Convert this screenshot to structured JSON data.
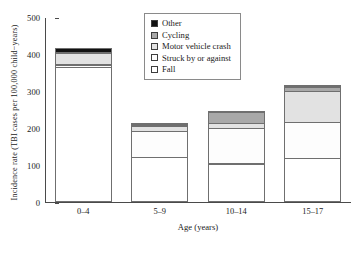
{
  "chart_data": {
    "type": "bar",
    "stacked": true,
    "title": "",
    "xlabel": "Age (years)",
    "ylabel": "Incidence rate (TBI cases per 100,000 child−years)",
    "categories": [
      "0–4",
      "5–9",
      "10–14",
      "15–17"
    ],
    "ylim": [
      0,
      500
    ],
    "yticks": [
      0,
      100,
      200,
      300,
      400,
      500
    ],
    "grid": false,
    "legend_position": "top-center",
    "series": [
      {
        "name": "Fall",
        "color": "#ffffff",
        "values": [
          365,
          122,
          104,
          118
        ]
      },
      {
        "name": "Struck by or against",
        "color": "#fdfdfd",
        "values": [
          8,
          72,
          97,
          99
        ]
      },
      {
        "name": "Motor vehicle crash",
        "color": "#e2e2e2",
        "values": [
          33,
          14,
          16,
          87
        ]
      },
      {
        "name": "Cycling",
        "color": "#a8a8a8",
        "values": [
          4,
          7,
          31,
          13
        ]
      },
      {
        "name": "Other",
        "color": "#111111",
        "values": [
          12,
          7,
          5,
          8
        ]
      }
    ],
    "totals": [
      422,
      222,
      253,
      325
    ]
  },
  "legend": {
    "items": [
      {
        "label": "Other",
        "color": "#111111"
      },
      {
        "label": "Cycling",
        "color": "#a8a8a8"
      },
      {
        "label": "Motor vehicle crash",
        "color": "#e2e2e2"
      },
      {
        "label": "Struck by or against",
        "color": "#fdfdfd"
      },
      {
        "label": "Fall",
        "color": "#ffffff"
      }
    ]
  }
}
